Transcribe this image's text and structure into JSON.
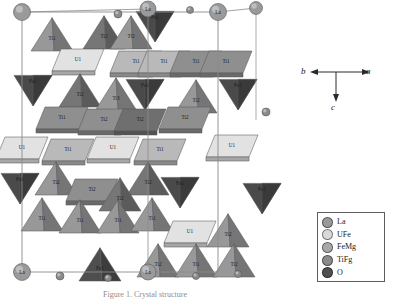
{
  "figure": {
    "caption": "Figure 1. Crystal structure"
  },
  "axes": {
    "a_label": "a",
    "b_label": "b",
    "c_label": "c"
  },
  "legend": {
    "items": [
      {
        "label": "La",
        "color": "#9a9a9a"
      },
      {
        "label": "UFe",
        "color": "#d9d9d9"
      },
      {
        "label": "FeMg",
        "color": "#a8a8a8"
      },
      {
        "label": "TiFg",
        "color": "#8b8b8b"
      },
      {
        "label": "O",
        "color": "#4f4f4f"
      }
    ]
  },
  "structure": {
    "colors": {
      "u_face": "#e2e2e2",
      "u_face_dark": "#cfcfcf",
      "ti_light": "#b9b9b9",
      "ti_mid": "#8f8f8f",
      "ti_dark": "#6f6f6f",
      "fe_dark": "#4a4a4a",
      "white_face": "#f7f7f7",
      "edge": "#5a5a5a",
      "cell_edge": "#7a7a7a",
      "la_sphere": "#9a9a9a",
      "o_sphere": "#8a8a8a"
    },
    "polyhedra": [
      {
        "name": "Ti1",
        "x": 52,
        "y": 32,
        "shade": "ti_mid",
        "shape": "tri-up"
      },
      {
        "name": "Ti2",
        "x": 104,
        "y": 30,
        "shade": "ti_dark",
        "shape": "tri-up"
      },
      {
        "name": "TO",
        "x": 131,
        "y": 30,
        "shade": "ti_mid",
        "shape": "tri-up"
      },
      {
        "name": "Fe1",
        "x": 155,
        "y": 24,
        "shade": "fe_dark",
        "shape": "tri-down"
      },
      {
        "name": "U1",
        "x": 78,
        "y": 60,
        "shade": "u_face",
        "shape": "rhomb"
      },
      {
        "name": "Ti1",
        "x": 136,
        "y": 62,
        "shade": "ti_light",
        "shape": "rhomb"
      },
      {
        "name": "Ti1",
        "x": 164,
        "y": 62,
        "shade": "ti_light",
        "shape": "rhomb"
      },
      {
        "name": "Ti1",
        "x": 196,
        "y": 62,
        "shade": "ti_mid",
        "shape": "rhomb"
      },
      {
        "name": "Ti1",
        "x": 226,
        "y": 62,
        "shade": "ti_mid",
        "shape": "rhomb"
      },
      {
        "name": "Fe1",
        "x": 33,
        "y": 88,
        "shade": "fe_dark",
        "shape": "tri-down"
      },
      {
        "name": "Ti2",
        "x": 80,
        "y": 88,
        "shade": "ti_dark",
        "shape": "tri-up"
      },
      {
        "name": "Ti3",
        "x": 116,
        "y": 92,
        "shade": "ti_mid",
        "shape": "tri-up"
      },
      {
        "name": "Fe1",
        "x": 145,
        "y": 92,
        "shade": "fe_dark",
        "shape": "tri-down"
      },
      {
        "name": "Ti2",
        "x": 196,
        "y": 94,
        "shade": "ti_mid",
        "shape": "tri-up"
      },
      {
        "name": "Fe1",
        "x": 238,
        "y": 92,
        "shade": "fe_dark",
        "shape": "tri-down"
      },
      {
        "name": "Ti1",
        "x": 62,
        "y": 118,
        "shade": "ti_mid",
        "shape": "rhomb"
      },
      {
        "name": "Ti2",
        "x": 104,
        "y": 120,
        "shade": "ti_mid",
        "shape": "rhomb"
      },
      {
        "name": "Ti2",
        "x": 140,
        "y": 120,
        "shade": "ti_dark",
        "shape": "rhomb"
      },
      {
        "name": "Ti2",
        "x": 185,
        "y": 118,
        "shade": "ti_mid",
        "shape": "rhomb"
      },
      {
        "name": "U1",
        "x": 22,
        "y": 148,
        "shade": "u_face",
        "shape": "rhomb"
      },
      {
        "name": "Ti1",
        "x": 68,
        "y": 150,
        "shade": "ti_light",
        "shape": "rhomb"
      },
      {
        "name": "U1",
        "x": 113,
        "y": 148,
        "shade": "u_face",
        "shape": "rhomb"
      },
      {
        "name": "Ti1",
        "x": 160,
        "y": 150,
        "shade": "ti_light",
        "shape": "rhomb"
      },
      {
        "name": "U1",
        "x": 232,
        "y": 146,
        "shade": "u_face",
        "shape": "rhomb"
      },
      {
        "name": "Ti2",
        "x": 56,
        "y": 176,
        "shade": "ti_mid",
        "shape": "tri-up"
      },
      {
        "name": "Ti2",
        "x": 148,
        "y": 176,
        "shade": "ti_dark",
        "shape": "tri-up"
      },
      {
        "name": "Fe1",
        "x": 20,
        "y": 186,
        "shade": "fe_dark",
        "shape": "tri-down"
      },
      {
        "name": "Ti2",
        "x": 92,
        "y": 190,
        "shade": "ti_mid",
        "shape": "rhomb"
      },
      {
        "name": "Ti2",
        "x": 120,
        "y": 192,
        "shade": "ti_dark",
        "shape": "tri-up"
      },
      {
        "name": "Fe1",
        "x": 180,
        "y": 190,
        "shade": "fe_dark",
        "shape": "tri-down"
      },
      {
        "name": "Fe1",
        "x": 262,
        "y": 196,
        "shade": "fe_dark",
        "shape": "tri-down"
      },
      {
        "name": "Ti1",
        "x": 42,
        "y": 212,
        "shade": "ti_mid",
        "shape": "tri-up"
      },
      {
        "name": "Ti1",
        "x": 80,
        "y": 214,
        "shade": "ti_mid",
        "shape": "tri-up"
      },
      {
        "name": "Ti1",
        "x": 118,
        "y": 214,
        "shade": "ti_mid",
        "shape": "tri-up"
      },
      {
        "name": "Ti1",
        "x": 152,
        "y": 212,
        "shade": "ti_mid",
        "shape": "tri-up"
      },
      {
        "name": "U1",
        "x": 190,
        "y": 232,
        "shade": "u_face",
        "shape": "rhomb"
      },
      {
        "name": "Ti2",
        "x": 228,
        "y": 228,
        "shade": "ti_mid",
        "shape": "tri-up"
      },
      {
        "name": "Fe1",
        "x": 100,
        "y": 262,
        "shade": "fe_dark",
        "shape": "tri-up"
      },
      {
        "name": "Ti2",
        "x": 158,
        "y": 258,
        "shade": "ti_mid",
        "shape": "tri-up"
      },
      {
        "name": "Ti1",
        "x": 196,
        "y": 258,
        "shade": "ti_mid",
        "shape": "tri-up"
      },
      {
        "name": "Ti2",
        "x": 234,
        "y": 258,
        "shade": "ti_mid",
        "shape": "tri-up"
      }
    ],
    "corner_atoms": [
      {
        "name": "La",
        "x": 22,
        "y": 12,
        "r": 8.5,
        "label": ""
      },
      {
        "name": "La",
        "x": 148,
        "y": 9,
        "r": 8.0,
        "label": "La"
      },
      {
        "name": "La",
        "x": 218,
        "y": 12,
        "r": 8.5,
        "label": "La"
      },
      {
        "name": "La",
        "x": 22,
        "y": 272,
        "r": 8.5,
        "label": "La"
      },
      {
        "name": "La",
        "x": 148,
        "y": 272,
        "r": 8.0,
        "label": "La"
      },
      {
        "name": "La",
        "x": 256,
        "y": 8,
        "r": 6.5,
        "label": ""
      },
      {
        "name": "O",
        "x": 118,
        "y": 14,
        "r": 4.0,
        "label": ""
      },
      {
        "name": "O",
        "x": 190,
        "y": 10,
        "r": 3.5,
        "label": ""
      },
      {
        "name": "O",
        "x": 60,
        "y": 276,
        "r": 4.0,
        "label": ""
      },
      {
        "name": "O",
        "x": 108,
        "y": 278,
        "r": 3.5,
        "label": ""
      },
      {
        "name": "O",
        "x": 196,
        "y": 276,
        "r": 3.5,
        "label": ""
      },
      {
        "name": "O",
        "x": 238,
        "y": 274,
        "r": 3.5,
        "label": ""
      },
      {
        "name": "O",
        "x": 266,
        "y": 112,
        "r": 4.0,
        "label": ""
      }
    ]
  }
}
